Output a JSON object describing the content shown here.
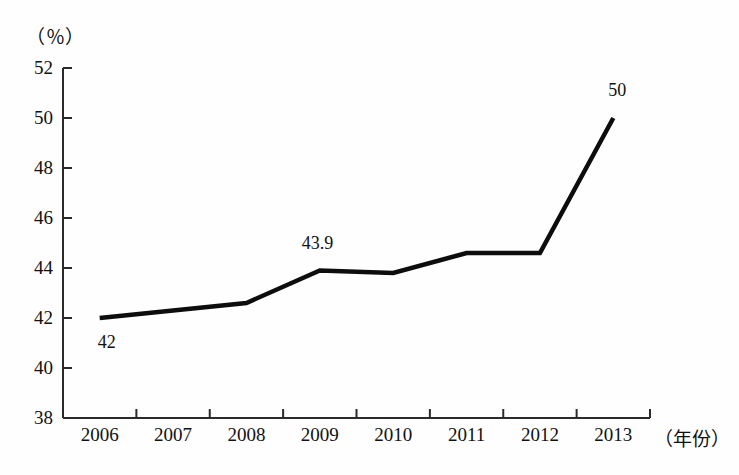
{
  "chart_data": {
    "type": "line",
    "title": "",
    "subtitle": "",
    "xlabel": "（年份）",
    "ylabel": "（％）",
    "x": [
      "2006",
      "2007",
      "2008",
      "2009",
      "2010",
      "2011",
      "2012",
      "2013"
    ],
    "categories": [
      "2006",
      "2007",
      "2008",
      "2009",
      "2010",
      "2011",
      "2012",
      "2013"
    ],
    "values": [
      42.0,
      42.3,
      42.6,
      43.9,
      43.8,
      44.6,
      44.6,
      50.0
    ],
    "series": [
      {
        "name": "",
        "values": [
          42.0,
          42.3,
          42.6,
          43.9,
          43.8,
          44.6,
          44.6,
          50.0
        ]
      }
    ],
    "ylim": [
      38,
      52
    ],
    "yticks": [
      38,
      40,
      42,
      44,
      46,
      48,
      50,
      52
    ],
    "ytick_labels": [
      "38",
      "40",
      "42",
      "44",
      "46",
      "48",
      "50",
      "52"
    ],
    "xtick_labels": [
      "2006",
      "2007",
      "2008",
      "2009",
      "2010",
      "2011",
      "2012",
      "2013"
    ],
    "grid": false,
    "legend": false,
    "legend_position": "none",
    "annotations": [
      {
        "text": "42",
        "x": "2006",
        "y": 42.0,
        "position": "below-right"
      },
      {
        "text": "43.9",
        "x": "2009",
        "y": 43.9,
        "position": "above"
      },
      {
        "text": "50",
        "x": "2013",
        "y": 50.0,
        "position": "above-right"
      }
    ],
    "line_color": "#0d0d0d",
    "axis_color": "#2a2a2a",
    "background_color": "#fefefe"
  }
}
